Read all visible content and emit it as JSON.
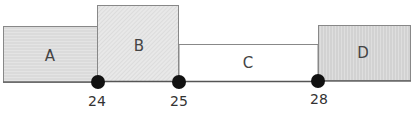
{
  "diagram": {
    "type": "timeline-blocks",
    "blocks": [
      {
        "label": "A",
        "pattern": "horizontal-lines",
        "fill": "#e2e2e2"
      },
      {
        "label": "B",
        "pattern": "diagonal-hatch",
        "fill": "#e6e6e6"
      },
      {
        "label": "C",
        "pattern": "none",
        "fill": "#ffffff"
      },
      {
        "label": "D",
        "pattern": "vertical-lines",
        "fill": "#dcdcdc"
      }
    ],
    "markers": [
      {
        "label": "24"
      },
      {
        "label": "25"
      },
      {
        "label": "28"
      }
    ],
    "colors": {
      "border": "#777777",
      "baseline": "#555555",
      "marker": "#111111"
    }
  }
}
